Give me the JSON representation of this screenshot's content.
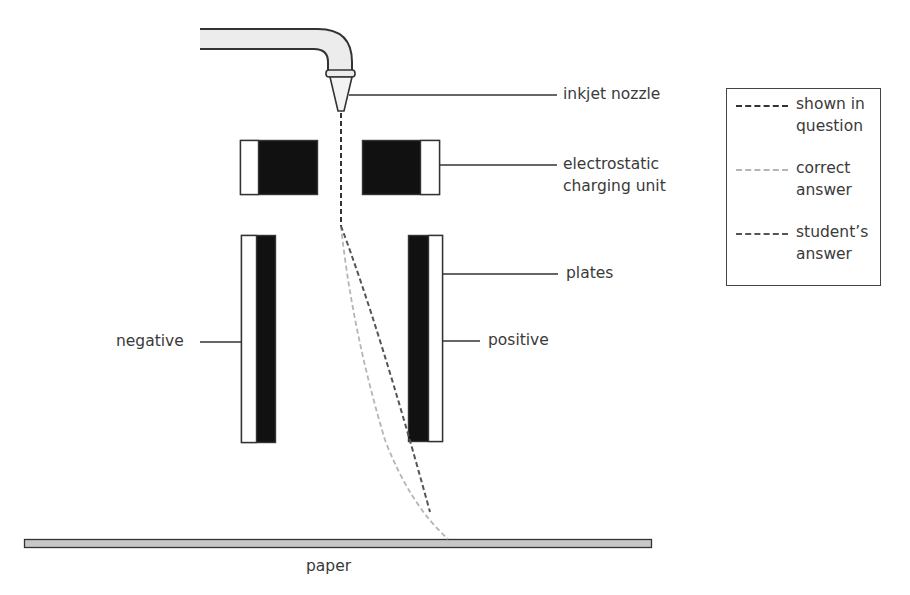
{
  "figure": {
    "type": "inkjet printer deflection diagram",
    "labels": {
      "nozzle": "inkjet nozzle",
      "charging_unit_line1": "electrostatic",
      "charging_unit_line2": "charging unit",
      "plates": "plates",
      "negative": "negative",
      "positive": "positive",
      "paper": "paper"
    },
    "legend": {
      "items": [
        {
          "line1": "shown in",
          "line2": "question",
          "color": "#333333",
          "style": "dashed"
        },
        {
          "line1": "correct",
          "line2": "answer",
          "color": "#b5b5b5",
          "style": "dashed"
        },
        {
          "line1": "student’s",
          "line2": "answer",
          "color": "#555555",
          "style": "dashed"
        }
      ]
    },
    "colors": {
      "plate_fill": "#111111",
      "paper_fill": "#c8c8c8",
      "tube_fill": "#ececec",
      "outline": "#333333"
    }
  }
}
